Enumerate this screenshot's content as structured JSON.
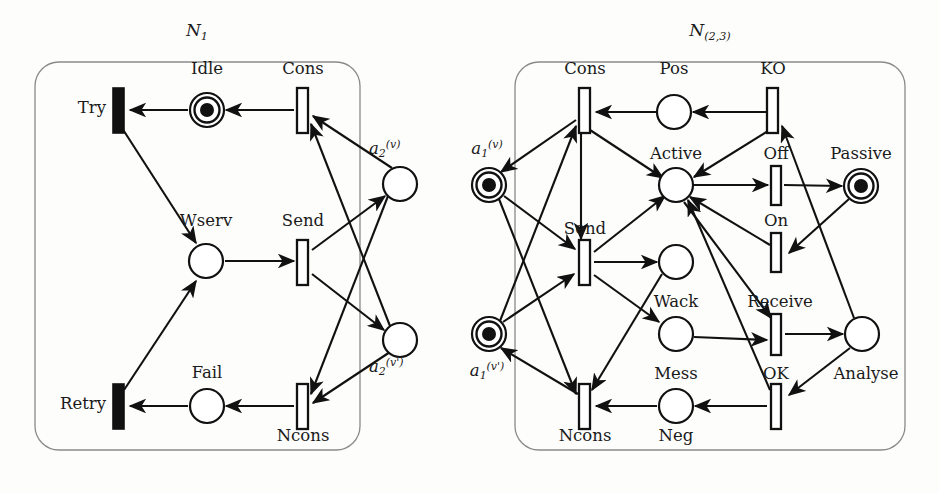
{
  "figure": {
    "kind": "petri-net-diagram",
    "background": "#fdfdfc",
    "ink": "#111111",
    "frame_color": "#8a8a8a",
    "width": 939,
    "height": 493
  },
  "networks": [
    {
      "id": "N1",
      "title_main": "N",
      "title_sub": "1",
      "frame": {
        "x": 35,
        "y": 62,
        "w": 325,
        "h": 388,
        "r": 24
      }
    },
    {
      "id": "N23",
      "title_main": "N",
      "title_sub": "(2,3)",
      "frame": {
        "x": 515,
        "y": 62,
        "w": 390,
        "h": 388,
        "r": 24
      }
    }
  ],
  "left_net": {
    "transitions": [
      {
        "name": "Try",
        "label": "Try",
        "style": "solid",
        "x": 119,
        "y": 110,
        "lx": 108,
        "ly": 101,
        "align": "right"
      },
      {
        "name": "Cons",
        "label": "Cons",
        "style": "hollow",
        "x": 303,
        "y": 110,
        "lx": 303,
        "ly": 62,
        "align": "center"
      },
      {
        "name": "Send",
        "label": "Send",
        "style": "hollow",
        "x": 303,
        "y": 262,
        "lx": 303,
        "ly": 214,
        "align": "center"
      },
      {
        "name": "Ncons",
        "label": "Ncons",
        "style": "hollow",
        "x": 303,
        "y": 406,
        "lx": 303,
        "ly": 428,
        "align": "center"
      },
      {
        "name": "Retry",
        "label": "Retry",
        "style": "solid",
        "x": 119,
        "y": 406,
        "lx": 108,
        "ly": 397,
        "align": "right"
      }
    ],
    "places": [
      {
        "name": "Idle",
        "label": "Idle",
        "tokens": 1,
        "x": 207,
        "y": 110,
        "lx": 207,
        "ly": 62,
        "align": "center"
      },
      {
        "name": "Wserv",
        "label": "Wserv",
        "tokens": 0,
        "x": 206,
        "y": 261,
        "lx": 206,
        "ly": 214,
        "align": "center"
      },
      {
        "name": "Fail",
        "label": "Fail",
        "tokens": 0,
        "x": 207,
        "y": 406,
        "lx": 207,
        "ly": 365,
        "align": "center"
      },
      {
        "name": "a2v",
        "label": "a",
        "sub": "2",
        "sup": "(v)",
        "tokens": 0,
        "x": 400,
        "y": 184,
        "lx": 372,
        "ly": 140,
        "align": "left"
      },
      {
        "name": "a2vp",
        "label": "a",
        "sub": "2",
        "sup": "(v')",
        "tokens": 0,
        "x": 400,
        "y": 340,
        "lx": 372,
        "ly": 356,
        "align": "left"
      }
    ],
    "arcs": [
      {
        "from": "Cons",
        "to": "Idle",
        "note": "Cons to Idle"
      },
      {
        "from": "Idle",
        "to": "Try",
        "note": "Idle to Try"
      },
      {
        "from": "Try",
        "to": "Wserv",
        "note": "Try to Wserv"
      },
      {
        "from": "Wserv",
        "to": "Send",
        "note": "Wserv to Send"
      },
      {
        "from": "Send",
        "to": "a2v",
        "note": "Send to a2(v)"
      },
      {
        "from": "Send",
        "to": "a2vp",
        "note": "Send to a2(v')"
      },
      {
        "from": "a2v",
        "to": "Cons",
        "note": "a2(v) to Cons"
      },
      {
        "from": "a2vp",
        "to": "Cons",
        "note": "a2(v') to Cons"
      },
      {
        "from": "a2v",
        "to": "Ncons",
        "note": "a2(v) to Ncons"
      },
      {
        "from": "a2vp",
        "to": "Ncons",
        "note": "a2(v') to Ncons"
      },
      {
        "from": "Ncons",
        "to": "Fail",
        "note": "Ncons to Fail"
      },
      {
        "from": "Fail",
        "to": "Retry",
        "note": "Fail to Retry"
      },
      {
        "from": "Retry",
        "to": "Wserv",
        "note": "Retry to Wserv"
      }
    ]
  },
  "right_net": {
    "transitions": [
      {
        "name": "Cons",
        "label": "Cons",
        "style": "hollow",
        "x": 585,
        "y": 110,
        "lx": 585,
        "ly": 62,
        "align": "center"
      },
      {
        "name": "KO",
        "label": "KO",
        "style": "hollow",
        "x": 773,
        "y": 110,
        "lx": 773,
        "ly": 62,
        "align": "center"
      },
      {
        "name": "Off",
        "label": "Off",
        "style": "hollow",
        "x": 776,
        "y": 185,
        "lx": 776,
        "ly": 146,
        "align": "center"
      },
      {
        "name": "On",
        "label": "On",
        "style": "hollow",
        "x": 776,
        "y": 252,
        "lx": 776,
        "ly": 213,
        "align": "center"
      },
      {
        "name": "Send",
        "label": "Send",
        "style": "hollow",
        "x": 585,
        "y": 262,
        "lx": 585,
        "ly": 222,
        "align": "center"
      },
      {
        "name": "Receive",
        "label": "Receive",
        "style": "hollow",
        "x": 776,
        "y": 334,
        "lx": 776,
        "ly": 296,
        "align": "center"
      },
      {
        "name": "OK",
        "label": "OK",
        "style": "hollow",
        "x": 776,
        "y": 406,
        "lx": 776,
        "ly": 366,
        "align": "center"
      },
      {
        "name": "Ncons",
        "label": "Ncons",
        "style": "hollow",
        "x": 585,
        "y": 406,
        "lx": 585,
        "ly": 428,
        "align": "center"
      }
    ],
    "places": [
      {
        "name": "a1v",
        "label": "a",
        "sub": "1",
        "sup": "(v)",
        "tokens": 1,
        "x": 489,
        "y": 185,
        "lx": 489,
        "ly": 140,
        "align": "center"
      },
      {
        "name": "a1vp",
        "label": "a",
        "sub": "1",
        "sup": "(v')",
        "tokens": 1,
        "x": 489,
        "y": 334,
        "lx": 489,
        "ly": 360,
        "align": "center"
      },
      {
        "name": "Pos",
        "label": "Pos",
        "tokens": 0,
        "x": 674,
        "y": 112,
        "lx": 674,
        "ly": 62,
        "align": "center"
      },
      {
        "name": "Active",
        "label": "Active",
        "tokens": 0,
        "x": 676,
        "y": 185,
        "lx": 676,
        "ly": 146,
        "align": "center"
      },
      {
        "name": "Passive",
        "label": "Passive",
        "tokens": 1,
        "x": 861,
        "y": 186,
        "lx": 861,
        "ly": 146,
        "align": "center"
      },
      {
        "name": "Wack",
        "label": "Wack",
        "tokens": 0,
        "x": 676,
        "y": 262,
        "lx": 676,
        "ly": 296,
        "align": "center"
      },
      {
        "name": "Mess",
        "label": "Mess",
        "tokens": 0,
        "x": 676,
        "y": 334,
        "lx": 676,
        "ly": 368,
        "align": "center"
      },
      {
        "name": "Analyse",
        "label": "Analyse",
        "tokens": 0,
        "x": 862,
        "y": 334,
        "lx": 862,
        "ly": 368,
        "align": "center"
      },
      {
        "name": "Neg",
        "label": "Neg",
        "tokens": 0,
        "x": 676,
        "y": 406,
        "lx": 676,
        "ly": 428,
        "align": "center"
      }
    ],
    "arcs": [
      {
        "from": "Cons",
        "to": "a1v",
        "note": "Cons to a1(v)"
      },
      {
        "from": "Cons",
        "to": "Send",
        "note": "Cons to Send"
      },
      {
        "from": "Pos",
        "to": "Cons",
        "note": "Pos to Cons"
      },
      {
        "from": "KO",
        "to": "Pos",
        "note": "KO to Pos"
      },
      {
        "from": "KO",
        "to": "Active",
        "note": "KO to Active"
      },
      {
        "from": "Active",
        "to": "Off",
        "note": "Active to Off"
      },
      {
        "from": "Off",
        "to": "Passive",
        "note": "Off to Passive"
      },
      {
        "from": "Passive",
        "to": "On",
        "note": "Passive to On"
      },
      {
        "from": "On",
        "to": "Active",
        "note": "On to Active"
      },
      {
        "from": "a1v",
        "to": "Send",
        "note": "a1(v) to Send"
      },
      {
        "from": "a1vp",
        "to": "Send",
        "note": "a1(v') to Send"
      },
      {
        "from": "a1v",
        "to": "Ncons",
        "note": "a1(v) to Ncons"
      },
      {
        "from": "a1vp",
        "to": "Cons",
        "note": "a1(v') to Cons"
      },
      {
        "from": "Send",
        "to": "Wack",
        "note": "Send to Wack"
      },
      {
        "from": "Send",
        "to": "Mess",
        "note": "Send to Mess"
      },
      {
        "from": "Mess",
        "to": "Receive",
        "note": "Mess to Receive"
      },
      {
        "from": "Active",
        "to": "Receive",
        "note": "Active to Receive"
      },
      {
        "from": "Receive",
        "to": "Analyse",
        "note": "Receive to Analyse"
      },
      {
        "from": "Analyse",
        "to": "KO",
        "note": "Analyse to KO"
      },
      {
        "from": "Analyse",
        "to": "OK",
        "note": "Analyse to OK"
      },
      {
        "from": "OK",
        "to": "Neg",
        "note": "OK to Neg"
      },
      {
        "from": "OK",
        "to": "Active",
        "note": "OK to Active"
      },
      {
        "from": "Neg",
        "to": "Ncons",
        "note": "Neg to Ncons"
      },
      {
        "from": "Ncons",
        "to": "a1vp",
        "note": "Ncons to a1(v')"
      },
      {
        "from": "Wack",
        "to": "Ncons",
        "note": "Wack to Ncons"
      },
      {
        "from": "Cons",
        "to": "Active",
        "note": "Cons to Active"
      },
      {
        "from": "Send",
        "to": "Active",
        "note": "Send to Active"
      }
    ]
  }
}
